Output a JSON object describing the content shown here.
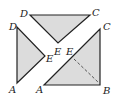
{
  "diagram": {
    "colors": {
      "fill": "#dcdcdc",
      "stroke": "#222222",
      "background": "#ffffff"
    },
    "pieces": [
      {
        "name": "top-triangle",
        "vertices": [
          "D",
          "E",
          "C"
        ],
        "points": "30,15 90,15 58,43",
        "labels": [
          {
            "text": "D",
            "x": 20,
            "y": 17
          },
          {
            "text": "C",
            "x": 92,
            "y": 16
          },
          {
            "text": "E",
            "x": 54,
            "y": 55
          }
        ]
      },
      {
        "name": "left-triangle",
        "vertices": [
          "D",
          "A",
          "E"
        ],
        "points": "17,27 17,83 45,56",
        "labels": [
          {
            "text": "D",
            "x": 9,
            "y": 30
          },
          {
            "text": "E",
            "x": 46,
            "y": 62
          },
          {
            "text": "A",
            "x": 9,
            "y": 93
          }
        ]
      },
      {
        "name": "bottom-right-triangle",
        "vertices": [
          "A",
          "B",
          "C"
        ],
        "points": "44,85 100,85 100,29",
        "labels": [
          {
            "text": "E",
            "x": 66,
            "y": 55
          },
          {
            "text": "C",
            "x": 103,
            "y": 30
          },
          {
            "text": "A",
            "x": 36,
            "y": 93
          },
          {
            "text": "B",
            "x": 103,
            "y": 94
          }
        ],
        "dashed_segment": {
          "from": "E",
          "to": "B",
          "x1": 74,
          "y1": 59,
          "x2": 99,
          "y2": 83
        }
      }
    ]
  }
}
